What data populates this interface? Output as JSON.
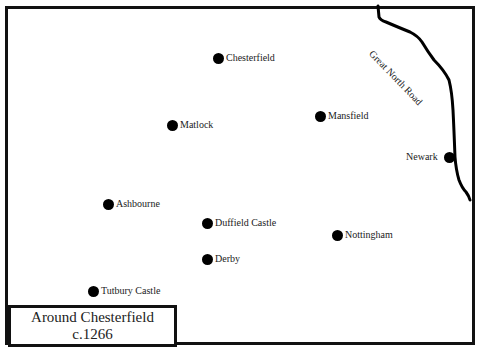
{
  "map": {
    "title": "Around Chesterfield",
    "subtitle": "c.1266",
    "road": {
      "name": "Great North Road"
    },
    "places": [
      {
        "name": "Chesterfield",
        "x": 219,
        "y": 58
      },
      {
        "name": "Matlock",
        "x": 173,
        "y": 125
      },
      {
        "name": "Mansfield",
        "x": 321,
        "y": 116
      },
      {
        "name": "Newark",
        "x": 455,
        "y": 157
      },
      {
        "name": "Ashbourne",
        "x": 109,
        "y": 204
      },
      {
        "name": "Duffield Castle",
        "x": 208,
        "y": 223
      },
      {
        "name": "Nottingham",
        "x": 338,
        "y": 235
      },
      {
        "name": "Derby",
        "x": 208,
        "y": 259
      },
      {
        "name": "Tutbury Castle",
        "x": 94,
        "y": 291
      }
    ]
  }
}
